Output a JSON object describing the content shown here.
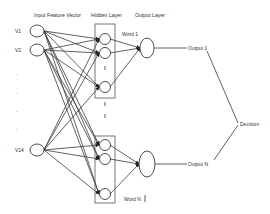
{
  "diagram": {
    "headers": {
      "input": "Input Feature Vector",
      "hidden": "Hidden Layer",
      "output": "Output Layer"
    },
    "inputs": [
      {
        "label": "V1",
        "y": 31
      },
      {
        "label": "V2",
        "y": 50
      },
      {
        "label": ".",
        "y": 75
      },
      {
        "label": ".",
        "y": 94
      },
      {
        "label": ".",
        "y": 112
      },
      {
        "label": ".",
        "y": 130
      },
      {
        "label": "V14",
        "y": 150
      }
    ],
    "hidden_groups": [
      {
        "box": {
          "x": 95,
          "y": 24,
          "w": 20,
          "h": 74
        },
        "nodes_y": [
          39,
          53,
          87
        ],
        "word_label": "Word 1"
      },
      {
        "box": {
          "x": 95,
          "y": 136,
          "w": 20,
          "h": 67
        },
        "nodes_y": [
          145,
          159,
          194
        ],
        "word_label": "Word N"
      }
    ],
    "outputs": [
      {
        "label": "Output 1"
      },
      {
        "label": "Output N"
      }
    ],
    "decision": {
      "label": "Decision"
    },
    "colors": {
      "stroke": "#3a3a3a",
      "text": "#333333",
      "background": "#ffffff"
    }
  }
}
